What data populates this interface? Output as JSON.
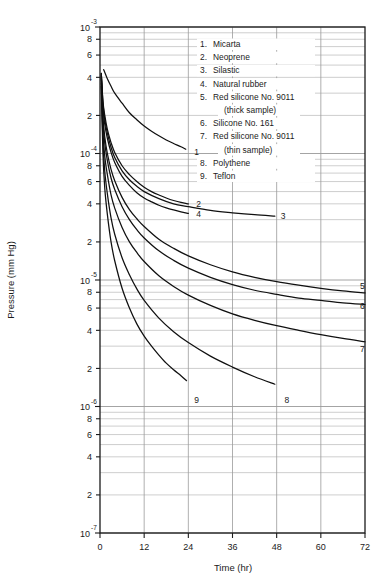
{
  "chart_data": {
    "type": "line",
    "title": "",
    "xlabel": "Time (hr)",
    "ylabel": "Pressure (mm Hg)",
    "xlim": [
      0,
      72
    ],
    "ylim": [
      1e-07,
      0.001
    ],
    "yscale": "log",
    "xscale": "linear",
    "grid": true,
    "legend_position": "inside-top-right",
    "xticks": [
      0,
      12,
      24,
      36,
      48,
      60,
      72
    ],
    "xtick_labels": [
      "0",
      "12",
      "24",
      "36",
      "48",
      "60",
      "72"
    ],
    "ytick_decades": [
      {
        "mantissa": "10",
        "exponent": "-3",
        "value": 0.001
      },
      {
        "mantissa": "10",
        "exponent": "-4",
        "value": 0.0001
      },
      {
        "mantissa": "10",
        "exponent": "-5",
        "value": 1e-05
      },
      {
        "mantissa": "10",
        "exponent": "-6",
        "value": 1e-06
      },
      {
        "mantissa": "10",
        "exponent": "-7",
        "value": 1e-07
      }
    ],
    "ytick_minor_labels": [
      "8",
      "6",
      "4",
      "2"
    ],
    "series": [
      {
        "name": "Micarta",
        "label": "1",
        "label_x": 24.0,
        "label_y": 0.000102,
        "points": [
          [
            1.0,
            0.00046
          ],
          [
            2,
            0.00039
          ],
          [
            3,
            0.00034
          ],
          [
            4,
            0.0003
          ],
          [
            6,
            0.00025
          ],
          [
            8,
            0.00021
          ],
          [
            10,
            0.000185
          ],
          [
            12,
            0.000165
          ],
          [
            14,
            0.00015
          ],
          [
            16,
            0.000138
          ],
          [
            18,
            0.000128
          ],
          [
            20,
            0.00012
          ],
          [
            22,
            0.000113
          ],
          [
            23.3,
            0.000108
          ]
        ]
      },
      {
        "name": "Neoprene",
        "label": "2",
        "label_x": 24.5,
        "label_y": 4e-05,
        "points": [
          [
            0.35,
            0.00043
          ],
          [
            0.8,
            0.00026
          ],
          [
            1.3,
            0.0002
          ],
          [
            2,
            0.000155
          ],
          [
            3,
            0.000122
          ],
          [
            4,
            0.000102
          ],
          [
            6,
            8e-05
          ],
          [
            8,
            6.8e-05
          ],
          [
            10,
            6e-05
          ],
          [
            12,
            5.4e-05
          ],
          [
            14,
            5e-05
          ],
          [
            16,
            4.7e-05
          ],
          [
            18,
            4.45e-05
          ],
          [
            20,
            4.25e-05
          ],
          [
            22,
            4.1e-05
          ],
          [
            24,
            4e-05
          ]
        ]
      },
      {
        "name": "Silastic",
        "label": "3",
        "label_x": 47.5,
        "label_y": 3.2e-05,
        "points": [
          [
            0.35,
            0.00043
          ],
          [
            0.8,
            0.00025
          ],
          [
            1.3,
            0.000185
          ],
          [
            2,
            0.000145
          ],
          [
            3,
            0.000112
          ],
          [
            4,
            9.3e-05
          ],
          [
            6,
            7.3e-05
          ],
          [
            8,
            6.2e-05
          ],
          [
            10,
            5.5e-05
          ],
          [
            12,
            5e-05
          ],
          [
            16,
            4.4e-05
          ],
          [
            20,
            4e-05
          ],
          [
            24,
            3.8e-05
          ],
          [
            30,
            3.55e-05
          ],
          [
            36,
            3.4e-05
          ],
          [
            42,
            3.28e-05
          ],
          [
            47.5,
            3.2e-05
          ]
        ]
      },
      {
        "name": "Natural rubber",
        "label": "4",
        "label_x": 24.5,
        "label_y": 3.35e-05,
        "points": [
          [
            0.35,
            0.00042
          ],
          [
            0.8,
            0.00023
          ],
          [
            1.3,
            0.00017
          ],
          [
            2,
            0.000132
          ],
          [
            3,
            0.000102
          ],
          [
            4,
            8.5e-05
          ],
          [
            6,
            6.6e-05
          ],
          [
            8,
            5.6e-05
          ],
          [
            10,
            4.9e-05
          ],
          [
            12,
            4.45e-05
          ],
          [
            14,
            4.15e-05
          ],
          [
            16,
            3.9e-05
          ],
          [
            18,
            3.72e-05
          ],
          [
            20,
            3.58e-05
          ],
          [
            22,
            3.46e-05
          ],
          [
            24,
            3.36e-05
          ]
        ]
      },
      {
        "name": "Red silicone No. 9011 (thick sample)",
        "label": "5",
        "label_x": 69.0,
        "label_y": 9e-06,
        "points": [
          [
            0.35,
            0.00041
          ],
          [
            0.8,
            0.000195
          ],
          [
            1.3,
            0.000135
          ],
          [
            2,
            0.0001
          ],
          [
            3,
            7.5e-05
          ],
          [
            4,
            6.1e-05
          ],
          [
            6,
            4.5e-05
          ],
          [
            8,
            3.6e-05
          ],
          [
            10,
            3.05e-05
          ],
          [
            12,
            2.65e-05
          ],
          [
            16,
            2.1e-05
          ],
          [
            20,
            1.78e-05
          ],
          [
            24,
            1.55e-05
          ],
          [
            30,
            1.32e-05
          ],
          [
            36,
            1.16e-05
          ],
          [
            42,
            1.05e-05
          ],
          [
            48,
            9.7e-06
          ],
          [
            54,
            9.1e-06
          ],
          [
            60,
            8.6e-06
          ],
          [
            66,
            8.2e-06
          ],
          [
            72,
            7.9e-06
          ]
        ]
      },
      {
        "name": "Silicone No. 161",
        "label": "6",
        "label_x": 69.0,
        "label_y": 6.2e-06,
        "points": [
          [
            0.35,
            0.0004
          ],
          [
            0.8,
            0.00018
          ],
          [
            1.3,
            0.00012
          ],
          [
            2,
            8.8e-05
          ],
          [
            3,
            6.4e-05
          ],
          [
            4,
            5.2e-05
          ],
          [
            6,
            3.8e-05
          ],
          [
            8,
            3e-05
          ],
          [
            10,
            2.5e-05
          ],
          [
            12,
            2.15e-05
          ],
          [
            16,
            1.7e-05
          ],
          [
            20,
            1.43e-05
          ],
          [
            24,
            1.24e-05
          ],
          [
            30,
            1.05e-05
          ],
          [
            36,
            9.2e-06
          ],
          [
            42,
            8.3e-06
          ],
          [
            48,
            7.7e-06
          ],
          [
            54,
            7.2e-06
          ],
          [
            60,
            6.9e-06
          ],
          [
            66,
            6.6e-06
          ],
          [
            72,
            6.4e-06
          ]
        ]
      },
      {
        "name": "Red silicone No. 9011 (thin sample)",
        "label": "7",
        "label_x": 69.0,
        "label_y": 2.85e-06,
        "points": [
          [
            0.35,
            0.00039
          ],
          [
            0.8,
            0.00015
          ],
          [
            1.3,
            9.5e-05
          ],
          [
            2,
            6.8e-05
          ],
          [
            3,
            4.7e-05
          ],
          [
            4,
            3.7e-05
          ],
          [
            6,
            2.6e-05
          ],
          [
            8,
            2e-05
          ],
          [
            10,
            1.65e-05
          ],
          [
            12,
            1.4e-05
          ],
          [
            16,
            1.08e-05
          ],
          [
            20,
            8.9e-06
          ],
          [
            24,
            7.6e-06
          ],
          [
            30,
            6.3e-06
          ],
          [
            36,
            5.4e-06
          ],
          [
            42,
            4.8e-06
          ],
          [
            48,
            4.35e-06
          ],
          [
            54,
            4e-06
          ],
          [
            60,
            3.7e-06
          ],
          [
            66,
            3.45e-06
          ],
          [
            72,
            3.25e-06
          ]
        ]
      },
      {
        "name": "Polythene",
        "label": "8",
        "label_x": 48.5,
        "label_y": 1.12e-06,
        "points": [
          [
            0.35,
            0.00036
          ],
          [
            0.8,
            0.000125
          ],
          [
            1.3,
            7.2e-05
          ],
          [
            2,
            4.8e-05
          ],
          [
            3,
            3.1e-05
          ],
          [
            4,
            2.3e-05
          ],
          [
            6,
            1.5e-05
          ],
          [
            8,
            1.1e-05
          ],
          [
            10,
            8.5e-06
          ],
          [
            12,
            6.9e-06
          ],
          [
            16,
            5e-06
          ],
          [
            20,
            3.9e-06
          ],
          [
            24,
            3.2e-06
          ],
          [
            30,
            2.5e-06
          ],
          [
            36,
            2.05e-06
          ],
          [
            42,
            1.72e-06
          ],
          [
            47.5,
            1.5e-06
          ]
        ]
      },
      {
        "name": "Teflon",
        "label": "9",
        "label_x": 24.0,
        "label_y": 1.12e-06,
        "points": [
          [
            0.35,
            0.00034
          ],
          [
            0.8,
            0.0001
          ],
          [
            1.3,
            5.3e-05
          ],
          [
            2,
            3.3e-05
          ],
          [
            3,
            2e-05
          ],
          [
            4,
            1.42e-05
          ],
          [
            6,
            8.6e-06
          ],
          [
            8,
            6e-06
          ],
          [
            10,
            4.5e-06
          ],
          [
            12,
            3.6e-06
          ],
          [
            14,
            3e-06
          ],
          [
            16,
            2.55e-06
          ],
          [
            18,
            2.2e-06
          ],
          [
            20,
            1.95e-06
          ],
          [
            22,
            1.75e-06
          ],
          [
            23.5,
            1.6e-06
          ]
        ]
      }
    ],
    "legend": [
      {
        "num": "1.",
        "text": "Micarta",
        "cont": ""
      },
      {
        "num": "2.",
        "text": "Neoprene",
        "cont": ""
      },
      {
        "num": "3.",
        "text": "Silastic",
        "cont": ""
      },
      {
        "num": "4.",
        "text": "Natural rubber",
        "cont": ""
      },
      {
        "num": "5.",
        "text": "Red silicone No. 9011",
        "cont": "(thick sample)"
      },
      {
        "num": "6.",
        "text": "Silicone No. 161",
        "cont": ""
      },
      {
        "num": "7.",
        "text": "Red silicone No. 9011",
        "cont": "(thin sample)"
      },
      {
        "num": "8.",
        "text": "Polythene",
        "cont": ""
      },
      {
        "num": "9.",
        "text": "Teflon",
        "cont": ""
      }
    ]
  }
}
